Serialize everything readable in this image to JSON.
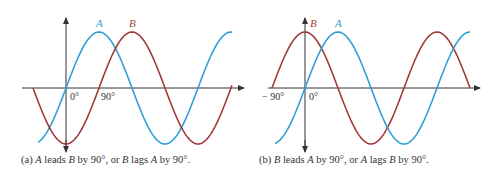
{
  "panels": [
    {
      "id": "a",
      "caption_parts": [
        "(a) ",
        "A",
        " leads ",
        "B",
        " by 90°, or ",
        "B",
        " lags ",
        "A",
        " by 90°."
      ],
      "tick_labels": [
        "0°",
        "90°"
      ],
      "curve_labels": [
        "A",
        "B"
      ],
      "colors": {
        "A": "#2f9fd6",
        "B": "#a33a3a"
      }
    },
    {
      "id": "b",
      "caption_parts": [
        "(b) ",
        "B",
        " leads ",
        "A",
        " by 90°, or ",
        "A",
        " lags ",
        "B",
        " by 90°."
      ],
      "tick_labels": [
        "− 90°",
        "0°"
      ],
      "curve_labels": [
        "B",
        "A"
      ],
      "colors": {
        "A": "#2f9fd6",
        "B": "#a33a3a"
      }
    }
  ],
  "axis_color": "#333333"
}
